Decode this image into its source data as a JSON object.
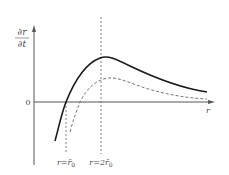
{
  "diagram": {
    "type": "function-curves",
    "y_axis_label": {
      "numerator": "∂r",
      "denominator": "∂t"
    },
    "x_axis_label": "r",
    "origin_label": "0",
    "reference_lines": [
      {
        "id": "r0",
        "label": "r=r̄₀",
        "label_main": "r=r̄",
        "label_sub": "0"
      },
      {
        "id": "2r0",
        "label": "r=2r̄₀",
        "label_main": "r=2r̄",
        "label_sub": "0"
      }
    ],
    "curves": [
      {
        "id": "solid-curve",
        "style": "solid",
        "description": "rises, crosses zero at r=r̄₀, peaks at r=2r̄₀, then decays"
      },
      {
        "id": "dashed-curve",
        "style": "dashed",
        "description": "lower curve, crosses zero after r̄₀, peaks after 2r̄₀, then decays"
      }
    ],
    "colors": {
      "axis": "#555555",
      "solid_curve": "#1a1a1a",
      "dashed_curve": "#777777",
      "reference_line": "#666666",
      "text": "#444444"
    }
  }
}
